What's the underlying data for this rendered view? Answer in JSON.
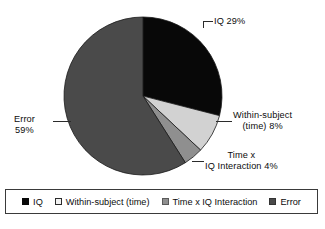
{
  "chart_data": {
    "type": "pie",
    "title": "",
    "subtitle": "",
    "xlabel": "",
    "ylabel": "",
    "grid": false,
    "legend_position": "bottom",
    "total_percent": 100,
    "start_angle_deg": 0,
    "direction": "clockwise",
    "categories": [
      "IQ",
      "Within-subject (time)",
      "Time x IQ Interaction",
      "Error"
    ],
    "values": [
      29,
      8,
      4,
      59
    ],
    "value_unit": "%",
    "colors": [
      "#080808",
      "#d2d2d2",
      "#8f8f8f",
      "#4a4a4a"
    ],
    "slices": [
      {
        "name": "IQ",
        "value": 29,
        "color": "#080808",
        "label_lines": [
          "IQ 29%"
        ],
        "callout": true
      },
      {
        "name": "Within-subject (time)",
        "value": 8,
        "color": "#d2d2d2",
        "label_lines": [
          "Within-subject",
          "(time) 8%"
        ],
        "callout": true
      },
      {
        "name": "Time x IQ Interaction",
        "value": 4,
        "color": "#8f8f8f",
        "label_lines": [
          "Time x",
          "IQ Interaction 4%"
        ],
        "callout": true
      },
      {
        "name": "Error",
        "value": 59,
        "color": "#4a4a4a",
        "label_lines": [
          "Error",
          "59%"
        ],
        "callout": true
      }
    ]
  },
  "labels": {
    "iq": {
      "line1": "IQ 29%"
    },
    "within": {
      "line1": "Within-subject",
      "line2": "(time) 8%"
    },
    "interaction": {
      "line1": "Time x",
      "line2": "IQ Interaction 4%"
    },
    "error": {
      "line1": "Error",
      "line2": "59%"
    }
  },
  "legend": {
    "items": [
      {
        "label": "IQ",
        "color": "#080808",
        "border": "#080808"
      },
      {
        "label": "Within-subject (time)",
        "color": "#f2f2f2",
        "border": "#2b2b2b"
      },
      {
        "label": "Time x IQ Interaction",
        "color": "#8f8f8f",
        "border": "#5a5a5a"
      },
      {
        "label": "Error",
        "color": "#4a4a4a",
        "border": "#333333"
      }
    ]
  },
  "geometry": {
    "center_x": 143,
    "center_y": 96,
    "radius": 79
  }
}
